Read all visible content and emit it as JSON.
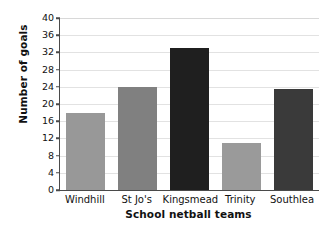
{
  "chart_data": {
    "type": "bar",
    "title": "",
    "subtitle": "",
    "xlabel": "School netball teams",
    "ylabel": "Number of goals",
    "categories": [
      "Windhill",
      "St Jo's",
      "Kingsmead",
      "Trinity",
      "Southlea"
    ],
    "values": [
      18,
      24,
      33,
      11,
      23.5
    ],
    "series": [
      {
        "name": "Number of goals",
        "values": [
          18,
          24,
          33,
          11,
          23.5
        ]
      }
    ],
    "bar_colors": [
      "#989898",
      "#808080",
      "#1f1f1f",
      "#9a9a9a",
      "#3a3a3a"
    ],
    "ylim": [
      0,
      40
    ],
    "ytick_step": 4,
    "ytick_labels": [
      "0",
      "4",
      "8",
      "12",
      "16",
      "20",
      "24",
      "28",
      "32",
      "36",
      "40"
    ],
    "ytick_values": [
      0,
      4,
      8,
      12,
      16,
      20,
      24,
      28,
      32,
      36,
      40
    ],
    "grid": true,
    "grid_axis": "y",
    "grid_color": "#e2e2e2",
    "legend": false,
    "legend_position": "none",
    "background_color": "#ffffff",
    "axis_color": "#4a4a4a",
    "text_color": "#111111"
  }
}
